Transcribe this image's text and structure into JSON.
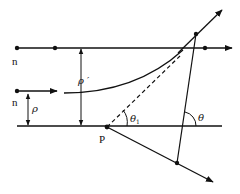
{
  "figure": {
    "labels": {
      "n_top": "n",
      "n_mid": "n",
      "rho": "ρ",
      "rho_prime": "ρ ′",
      "theta1_main": "θ",
      "theta1_sub": "1",
      "theta": "θ",
      "point_P": "P"
    },
    "colors": {
      "stroke": "#111111",
      "background": "#ffffff"
    }
  }
}
